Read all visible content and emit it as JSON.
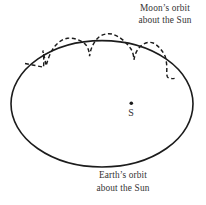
{
  "figure": {
    "moon_orbit_label": {
      "line1": "Moon’s orbit",
      "line2": "about the Sun"
    },
    "earth_orbit_label": {
      "line1": "Earth’s orbit",
      "line2": "about the Sun"
    },
    "sun_point_label": "S"
  },
  "colors": {
    "line": "#1c1c1c",
    "text": "#333333",
    "background": "#ffffff"
  }
}
